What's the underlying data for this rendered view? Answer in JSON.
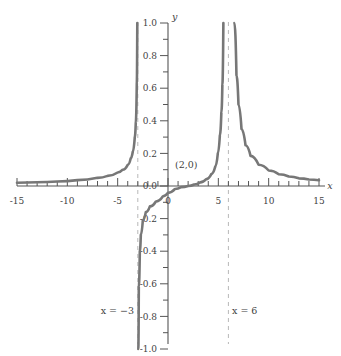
{
  "chart_data": {
    "type": "line",
    "title": "",
    "xlabel": "x",
    "ylabel": "y",
    "xlim": [
      -15,
      15
    ],
    "ylim": [
      -1.0,
      1.0
    ],
    "grid": false,
    "legend": "none",
    "x_major_ticks": [
      -15,
      -10,
      -5,
      0,
      5,
      10,
      15
    ],
    "x_major_tick_labels": [
      "-15",
      "-10",
      "-5",
      "0",
      "5",
      "10",
      "15"
    ],
    "x_minor_tick_interval": 1,
    "y_major_ticks": [
      1.0,
      0.8,
      0.6,
      0.4,
      0.2,
      0.0,
      -0.2,
      -0.4,
      -0.6,
      -0.8,
      -1.0
    ],
    "y_major_tick_labels": [
      "1.0",
      "0.8",
      "0.6",
      "0.4",
      "0.2",
      "0.0",
      "-0.2",
      "-0.4",
      "-0.6",
      "-0.8",
      "-1.0"
    ],
    "y_minor_tick_interval": 0.1,
    "series": [
      {
        "name": "rational-function",
        "description": "Rational curve with vertical asymptotes at x = -3 and x = 6 and an x-intercept at (2, 0)",
        "color": "#777777",
        "x_intercepts": [
          2
        ],
        "vertical_asymptotes": [
          -3,
          6
        ],
        "horizontal_asymptote": 0,
        "branches": [
          {
            "name": "left-branch",
            "domain": [
              -15,
              -3
            ],
            "points": [
              [
                -15,
                0.02
              ],
              [
                -13,
                0.023
              ],
              [
                -11,
                0.028
              ],
              [
                -9,
                0.036
              ],
              [
                -7,
                0.05
              ],
              [
                -6,
                0.062
              ],
              [
                -5,
                0.083
              ],
              [
                -4.5,
                0.1
              ],
              [
                -4,
                0.13
              ],
              [
                -3.7,
                0.17
              ],
              [
                -3.5,
                0.21
              ],
              [
                -3.3,
                0.3
              ],
              [
                -3.2,
                0.39
              ],
              [
                -3.1,
                0.63
              ],
              [
                -3.05,
                1.0
              ]
            ]
          },
          {
            "name": "middle-branch",
            "domain": [
              -3,
              6
            ],
            "points": [
              [
                -2.95,
                -1.0
              ],
              [
                -2.9,
                -0.62
              ],
              [
                -2.8,
                -0.4
              ],
              [
                -2.7,
                -0.3
              ],
              [
                -2.5,
                -0.21
              ],
              [
                -2.2,
                -0.16
              ],
              [
                -1.8,
                -0.125
              ],
              [
                -1.2,
                -0.095
              ],
              [
                -0.5,
                -0.063
              ],
              [
                0,
                -0.042
              ],
              [
                0.7,
                -0.018
              ],
              [
                1.3,
                -0.007
              ],
              [
                2,
                0.0
              ],
              [
                2.6,
                0.009
              ],
              [
                3.2,
                0.022
              ],
              [
                3.8,
                0.042
              ],
              [
                4.3,
                0.073
              ],
              [
                4.7,
                0.12
              ],
              [
                4.95,
                0.2
              ],
              [
                5.15,
                0.31
              ],
              [
                5.3,
                0.45
              ],
              [
                5.4,
                0.62
              ],
              [
                5.5,
                1.0
              ]
            ]
          },
          {
            "name": "right-branch",
            "domain": [
              6,
              15
            ],
            "points": [
              [
                6.6,
                1.0
              ],
              [
                6.8,
                0.68
              ],
              [
                7,
                0.5
              ],
              [
                7.3,
                0.35
              ],
              [
                7.7,
                0.25
              ],
              [
                8.2,
                0.185
              ],
              [
                9,
                0.13
              ],
              [
                10,
                0.095
              ],
              [
                11,
                0.072
              ],
              [
                12,
                0.058
              ],
              [
                13,
                0.047
              ],
              [
                14,
                0.04
              ],
              [
                15,
                0.035
              ]
            ]
          }
        ]
      }
    ],
    "annotations": [
      {
        "name": "x-intercept-label",
        "text": "(2,0)",
        "x": 2,
        "y": 0.08
      },
      {
        "name": "left-asymptote-label",
        "text": "x = −3",
        "x": -3,
        "y": -0.8
      },
      {
        "name": "right-asymptote-label",
        "text": "x = 6",
        "x": 6,
        "y": -0.8
      }
    ]
  },
  "axes": {
    "x_axis_name": "x",
    "y_axis_name": "y"
  },
  "labels": {
    "x_ticks": [
      "-15",
      "-10",
      "-5",
      "0",
      "5",
      "10",
      "15"
    ],
    "y_ticks": [
      "1.0",
      "0.8",
      "0.6",
      "0.4",
      "0.2",
      "0.0",
      "-0.2",
      "-0.4",
      "-0.6",
      "-0.8",
      "-1.0"
    ],
    "intercept": "(2,0)",
    "asymptote_left": "x = −3",
    "asymptote_right": "x = 6"
  },
  "colors": {
    "curve": "#777777",
    "axis": "#555555",
    "asymptote": "#b8b8b8",
    "text": "#3f3f3f",
    "background": "#ffffff"
  }
}
